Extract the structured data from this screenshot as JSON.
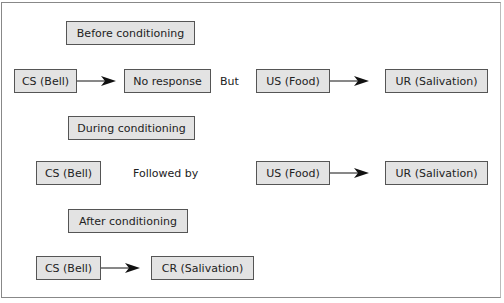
{
  "diagram": {
    "sections": [
      {
        "title": "Before conditioning",
        "row1": {
          "left": "CS (Bell)",
          "right": "No response"
        },
        "connector": "But",
        "row2": {
          "left": "US (Food)",
          "right": "UR (Salivation)"
        }
      },
      {
        "title": "During conditioning",
        "row1": {
          "left": "CS (Bell)"
        },
        "connector": "Followed by",
        "row2": {
          "left": "US (Food)",
          "right": "UR (Salivation)"
        }
      },
      {
        "title": "After conditioning",
        "row1": {
          "left": "CS (Bell)",
          "right": "CR (Salivation)"
        }
      }
    ],
    "colors": {
      "box_fill": "#e3e3e3",
      "box_border": "#555555",
      "arrow": "#111111"
    }
  }
}
